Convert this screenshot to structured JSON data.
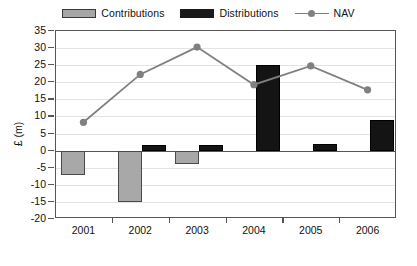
{
  "chart_data": {
    "type": "bar",
    "title": "",
    "xlabel": "",
    "ylabel": "£ (m)",
    "categories": [
      "2001",
      "2002",
      "2003",
      "2004",
      "2005",
      "2006"
    ],
    "ylim": [
      -20,
      35
    ],
    "ytick_step": 5,
    "ytick_labels": [
      "35",
      "30",
      "25",
      "20",
      "15",
      "10",
      "5",
      "0",
      "-5",
      "-10",
      "-15",
      "-20"
    ],
    "ytick_values": [
      35,
      30,
      25,
      20,
      15,
      10,
      5,
      0,
      -5,
      -10,
      -15,
      -20
    ],
    "grid": true,
    "legend_position": "top-center",
    "series": [
      {
        "name": "Contributions",
        "type": "bar",
        "color": "#a8a8a8",
        "values": [
          -7,
          -15,
          -4,
          0,
          0,
          0
        ]
      },
      {
        "name": "Distributions",
        "type": "bar",
        "color": "#141414",
        "values": [
          0,
          1.7,
          1.7,
          25,
          2,
          9
        ]
      },
      {
        "name": "NAV",
        "type": "line",
        "color": "#808080",
        "marker": "circle",
        "values": [
          8,
          22,
          30,
          19,
          24.5,
          17.5
        ]
      }
    ]
  },
  "legend": {
    "items": [
      {
        "label": "Contributions",
        "icon": "filled-rect-swatch",
        "color": "#a8a8a8"
      },
      {
        "label": "Distributions",
        "icon": "filled-rect-swatch",
        "color": "#141414"
      },
      {
        "label": "NAV",
        "icon": "line-marker-swatch",
        "color": "#808080"
      }
    ]
  }
}
